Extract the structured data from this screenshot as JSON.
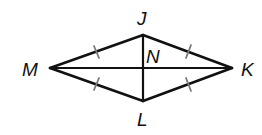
{
  "figure": {
    "type": "rhombus-with-diagonals",
    "vertices": {
      "J": {
        "label": "J",
        "x": 143,
        "y": 35
      },
      "K": {
        "label": "K",
        "x": 232,
        "y": 68
      },
      "L": {
        "label": "L",
        "x": 143,
        "y": 101
      },
      "M": {
        "label": "M",
        "x": 50,
        "y": 68
      }
    },
    "intersection": {
      "label": "N",
      "x": 143,
      "y": 68
    },
    "sides": [
      "MJ",
      "JK",
      "KL",
      "LM"
    ],
    "diagonals": [
      "MK",
      "JL"
    ],
    "congruence_ticks": {
      "count_per_side": 1,
      "sides": [
        "MJ",
        "JK",
        "KL",
        "LM"
      ],
      "color": "#7a7a7a"
    },
    "line_color": "#111111"
  },
  "labels": {
    "J": "J",
    "K": "K",
    "L": "L",
    "M": "M",
    "N": "N"
  }
}
